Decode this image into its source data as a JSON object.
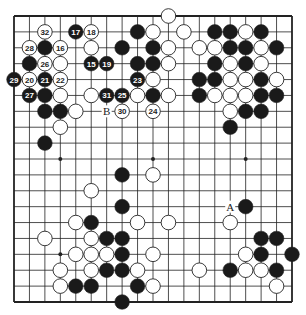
{
  "diagram": {
    "type": "go-board",
    "size": 19,
    "colors": {
      "background": "#ffffff",
      "line": "#222222",
      "black_stone": "#1a1a1a",
      "white_stone": "#ffffff",
      "label_on_black": "#ffffff",
      "label_on_white": "#222222"
    },
    "star_points": [
      [
        3,
        3
      ],
      [
        9,
        3
      ],
      [
        15,
        3
      ],
      [
        3,
        9
      ],
      [
        9,
        9
      ],
      [
        15,
        9
      ],
      [
        3,
        15
      ],
      [
        9,
        15
      ],
      [
        15,
        15
      ]
    ],
    "stones": [
      {
        "c": 10,
        "r": 0,
        "color": "white"
      },
      {
        "c": 2,
        "r": 1,
        "color": "white",
        "label": "32"
      },
      {
        "c": 4,
        "r": 1,
        "color": "black",
        "label": "17"
      },
      {
        "c": 5,
        "r": 1,
        "color": "white",
        "label": "18"
      },
      {
        "c": 8,
        "r": 1,
        "color": "black"
      },
      {
        "c": 9,
        "r": 1,
        "color": "white"
      },
      {
        "c": 11,
        "r": 1,
        "color": "white"
      },
      {
        "c": 13,
        "r": 1,
        "color": "black"
      },
      {
        "c": 14,
        "r": 1,
        "color": "black"
      },
      {
        "c": 15,
        "r": 1,
        "color": "white"
      },
      {
        "c": 16,
        "r": 1,
        "color": "black"
      },
      {
        "c": 1,
        "r": 2,
        "color": "white",
        "label": "28"
      },
      {
        "c": 2,
        "r": 2,
        "color": "black"
      },
      {
        "c": 3,
        "r": 2,
        "color": "white",
        "label": "16"
      },
      {
        "c": 5,
        "r": 2,
        "color": "white"
      },
      {
        "c": 7,
        "r": 2,
        "color": "black"
      },
      {
        "c": 9,
        "r": 2,
        "color": "black"
      },
      {
        "c": 10,
        "r": 2,
        "color": "white"
      },
      {
        "c": 12,
        "r": 2,
        "color": "white"
      },
      {
        "c": 13,
        "r": 2,
        "color": "white"
      },
      {
        "c": 14,
        "r": 2,
        "color": "black"
      },
      {
        "c": 15,
        "r": 2,
        "color": "black"
      },
      {
        "c": 16,
        "r": 2,
        "color": "white"
      },
      {
        "c": 17,
        "r": 2,
        "color": "black"
      },
      {
        "c": 1,
        "r": 3,
        "color": "black"
      },
      {
        "c": 2,
        "r": 3,
        "color": "white",
        "label": "26"
      },
      {
        "c": 3,
        "r": 3,
        "color": "white"
      },
      {
        "c": 5,
        "r": 3,
        "color": "black",
        "label": "15"
      },
      {
        "c": 6,
        "r": 3,
        "color": "black",
        "label": "19"
      },
      {
        "c": 8,
        "r": 3,
        "color": "black"
      },
      {
        "c": 9,
        "r": 3,
        "color": "black"
      },
      {
        "c": 10,
        "r": 3,
        "color": "white"
      },
      {
        "c": 13,
        "r": 3,
        "color": "black"
      },
      {
        "c": 14,
        "r": 3,
        "color": "white"
      },
      {
        "c": 15,
        "r": 3,
        "color": "black"
      },
      {
        "c": 16,
        "r": 3,
        "color": "white"
      },
      {
        "c": 0,
        "r": 4,
        "color": "black",
        "label": "29"
      },
      {
        "c": 1,
        "r": 4,
        "color": "white",
        "label": "20"
      },
      {
        "c": 2,
        "r": 4,
        "color": "black",
        "label": "21"
      },
      {
        "c": 3,
        "r": 4,
        "color": "white",
        "label": "22"
      },
      {
        "c": 8,
        "r": 4,
        "color": "black",
        "label": "23"
      },
      {
        "c": 9,
        "r": 4,
        "color": "white"
      },
      {
        "c": 12,
        "r": 4,
        "color": "black"
      },
      {
        "c": 13,
        "r": 4,
        "color": "black"
      },
      {
        "c": 14,
        "r": 4,
        "color": "white"
      },
      {
        "c": 15,
        "r": 4,
        "color": "white"
      },
      {
        "c": 16,
        "r": 4,
        "color": "black"
      },
      {
        "c": 17,
        "r": 4,
        "color": "white"
      },
      {
        "c": 1,
        "r": 5,
        "color": "black",
        "label": "27"
      },
      {
        "c": 2,
        "r": 5,
        "color": "black"
      },
      {
        "c": 3,
        "r": 5,
        "color": "white"
      },
      {
        "c": 5,
        "r": 5,
        "color": "white"
      },
      {
        "c": 6,
        "r": 5,
        "color": "black",
        "label": "31"
      },
      {
        "c": 7,
        "r": 5,
        "color": "black",
        "label": "25"
      },
      {
        "c": 8,
        "r": 5,
        "color": "white"
      },
      {
        "c": 9,
        "r": 5,
        "color": "black"
      },
      {
        "c": 10,
        "r": 5,
        "color": "white"
      },
      {
        "c": 12,
        "r": 5,
        "color": "black"
      },
      {
        "c": 13,
        "r": 5,
        "color": "white"
      },
      {
        "c": 14,
        "r": 5,
        "color": "white"
      },
      {
        "c": 15,
        "r": 5,
        "color": "white"
      },
      {
        "c": 16,
        "r": 5,
        "color": "black"
      },
      {
        "c": 17,
        "r": 5,
        "color": "black"
      },
      {
        "c": 2,
        "r": 6,
        "color": "black"
      },
      {
        "c": 3,
        "r": 6,
        "color": "black"
      },
      {
        "c": 4,
        "r": 6,
        "color": "white"
      },
      {
        "c": 7,
        "r": 6,
        "color": "white",
        "label": "30"
      },
      {
        "c": 9,
        "r": 6,
        "color": "white",
        "label": "24"
      },
      {
        "c": 14,
        "r": 6,
        "color": "white"
      },
      {
        "c": 15,
        "r": 6,
        "color": "black"
      },
      {
        "c": 16,
        "r": 6,
        "color": "black"
      },
      {
        "c": 3,
        "r": 7,
        "color": "white"
      },
      {
        "c": 14,
        "r": 7,
        "color": "black"
      },
      {
        "c": 2,
        "r": 8,
        "color": "black"
      },
      {
        "c": 7,
        "r": 10,
        "color": "black"
      },
      {
        "c": 9,
        "r": 10,
        "color": "white"
      },
      {
        "c": 5,
        "r": 11,
        "color": "white"
      },
      {
        "c": 7,
        "r": 12,
        "color": "black"
      },
      {
        "c": 15,
        "r": 12,
        "color": "black"
      },
      {
        "c": 4,
        "r": 13,
        "color": "white"
      },
      {
        "c": 5,
        "r": 13,
        "color": "black"
      },
      {
        "c": 8,
        "r": 13,
        "color": "white"
      },
      {
        "c": 10,
        "r": 13,
        "color": "white"
      },
      {
        "c": 14,
        "r": 13,
        "color": "white"
      },
      {
        "c": 2,
        "r": 14,
        "color": "white"
      },
      {
        "c": 5,
        "r": 14,
        "color": "white"
      },
      {
        "c": 6,
        "r": 14,
        "color": "black"
      },
      {
        "c": 7,
        "r": 14,
        "color": "black"
      },
      {
        "c": 16,
        "r": 14,
        "color": "black"
      },
      {
        "c": 17,
        "r": 14,
        "color": "black"
      },
      {
        "c": 4,
        "r": 15,
        "color": "white"
      },
      {
        "c": 5,
        "r": 15,
        "color": "white"
      },
      {
        "c": 6,
        "r": 15,
        "color": "white"
      },
      {
        "c": 7,
        "r": 15,
        "color": "black"
      },
      {
        "c": 9,
        "r": 15,
        "color": "white"
      },
      {
        "c": 15,
        "r": 15,
        "color": "white"
      },
      {
        "c": 16,
        "r": 15,
        "color": "black"
      },
      {
        "c": 18,
        "r": 15,
        "color": "black"
      },
      {
        "c": 3,
        "r": 16,
        "color": "white"
      },
      {
        "c": 5,
        "r": 16,
        "color": "white"
      },
      {
        "c": 6,
        "r": 16,
        "color": "black"
      },
      {
        "c": 7,
        "r": 16,
        "color": "black"
      },
      {
        "c": 8,
        "r": 16,
        "color": "white"
      },
      {
        "c": 12,
        "r": 16,
        "color": "white"
      },
      {
        "c": 14,
        "r": 16,
        "color": "black"
      },
      {
        "c": 15,
        "r": 16,
        "color": "white"
      },
      {
        "c": 16,
        "r": 16,
        "color": "white"
      },
      {
        "c": 17,
        "r": 16,
        "color": "black"
      },
      {
        "c": 3,
        "r": 17,
        "color": "white"
      },
      {
        "c": 4,
        "r": 17,
        "color": "black"
      },
      {
        "c": 5,
        "r": 17,
        "color": "black"
      },
      {
        "c": 8,
        "r": 17,
        "color": "black"
      },
      {
        "c": 9,
        "r": 17,
        "color": "white"
      },
      {
        "c": 17,
        "r": 17,
        "color": "white"
      },
      {
        "c": 7,
        "r": 18,
        "color": "black"
      }
    ],
    "markers": [
      {
        "c": 6,
        "r": 6,
        "text": "B"
      },
      {
        "c": 14,
        "r": 12,
        "text": "A"
      }
    ]
  }
}
